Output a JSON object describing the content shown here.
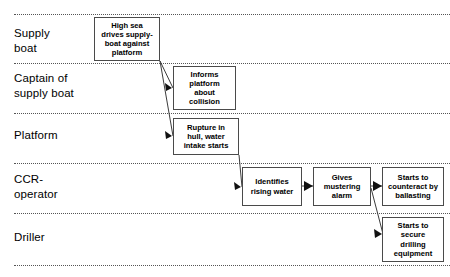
{
  "diagram": {
    "type": "swimlane-flow",
    "width": 450,
    "height": 277,
    "colors": {
      "background": "#ffffff",
      "box_border": "#4a4a4a",
      "divider": "#555555",
      "connector": "#3c3c3c",
      "text": "#000000"
    }
  },
  "lanes": [
    {
      "id": "supply-boat",
      "label": "Supply\nboat",
      "label_x": 14,
      "label_y": 26,
      "divider_top_y": 14,
      "divider_bottom_y": 63
    },
    {
      "id": "captain-of-supply-boat",
      "label": "Captain of\nsupply boat",
      "label_x": 14,
      "label_y": 71,
      "divider_top_y": 63,
      "divider_bottom_y": 113
    },
    {
      "id": "platform",
      "label": "Platform",
      "label_x": 14,
      "label_y": 128,
      "divider_top_y": 113,
      "divider_bottom_y": 163
    },
    {
      "id": "ccr-operator",
      "label": "CCR-\noperator",
      "label_x": 14,
      "label_y": 172,
      "divider_top_y": 163,
      "divider_bottom_y": 213
    },
    {
      "id": "driller",
      "label": "Driller",
      "label_x": 14,
      "label_y": 230,
      "divider_top_y": 213,
      "divider_bottom_y": 265
    }
  ],
  "dividers": [
    {
      "y": 14,
      "x": 14,
      "width": 436
    },
    {
      "y": 63,
      "x": 14,
      "width": 436
    },
    {
      "y": 113,
      "x": 14,
      "width": 436
    },
    {
      "y": 163,
      "x": 14,
      "width": 436
    },
    {
      "y": 213,
      "x": 14,
      "width": 436
    },
    {
      "y": 265,
      "x": 14,
      "width": 436
    }
  ],
  "boxes": [
    {
      "id": "high-sea-drives",
      "lane": "supply-boat",
      "text": "High sea\ndrives supply-\nboat against\nplatform",
      "x": 94,
      "y": 17,
      "w": 66,
      "h": 44
    },
    {
      "id": "informs-platform",
      "lane": "captain-of-supply-boat",
      "text": "Informs\nplatform\nabout\ncollision",
      "x": 173,
      "y": 66,
      "w": 63,
      "h": 44
    },
    {
      "id": "rupture-in-hull",
      "lane": "platform",
      "text": "Rupture in\nhull, water\nintake starts",
      "x": 173,
      "y": 118,
      "w": 66,
      "h": 37
    },
    {
      "id": "identifies-rising-water",
      "lane": "ccr-operator",
      "text": "Identifies\nrising water",
      "x": 242,
      "y": 167,
      "w": 60,
      "h": 39
    },
    {
      "id": "gives-mustering-alarm",
      "lane": "ccr-operator",
      "text": "Gives\nmustering\nalarm",
      "x": 313,
      "y": 167,
      "w": 58,
      "h": 39
    },
    {
      "id": "starts-to-counteract",
      "lane": "ccr-operator",
      "text": "Starts to\ncounteract by\nballasting",
      "x": 382,
      "y": 167,
      "w": 62,
      "h": 39
    },
    {
      "id": "starts-to-secure-drilling",
      "lane": "driller",
      "text": "Starts to\nsecure\ndrilling\nequipment",
      "x": 382,
      "y": 217,
      "w": 62,
      "h": 45
    }
  ],
  "connectors": [
    {
      "id": "high-sea-to-informs",
      "from": "high-sea-drives",
      "to": "informs-platform",
      "kind": "diagonal-arrow",
      "path": "M 160,61 L 173,88",
      "head": "172,88 165,83 166,91"
    },
    {
      "id": "high-sea-to-rupture",
      "from": "high-sea-drives",
      "to": "rupture-in-hull",
      "kind": "diagonal-arrow",
      "path": "M 160,61 L 173,136",
      "head": "172,136 165,131 166,139"
    },
    {
      "id": "rupture-to-identifies",
      "from": "rupture-in-hull",
      "to": "identifies-rising-water",
      "kind": "diagonal-arrow",
      "path": "M 239,155 L 242,187",
      "head": "241,187 234,182 235,190"
    },
    {
      "id": "identifies-to-gives",
      "from": "identifies-rising-water",
      "to": "gives-mustering-alarm",
      "kind": "horizontal-arrow",
      "path": "M 302,186 L 313,186",
      "head": "313,186 304,181 304,191"
    },
    {
      "id": "gives-to-counteract",
      "from": "gives-mustering-alarm",
      "to": "starts-to-counteract",
      "kind": "horizontal-arrow",
      "path": "M 371,186 L 382,186",
      "head": "382,186 373,181 373,191"
    },
    {
      "id": "gives-to-secure-drilling",
      "from": "gives-mustering-alarm",
      "to": "starts-to-secure-drilling",
      "kind": "diagonal-arrow",
      "path": "M 371,188 L 383,234",
      "head": "382,234 374,229 375,238"
    }
  ]
}
